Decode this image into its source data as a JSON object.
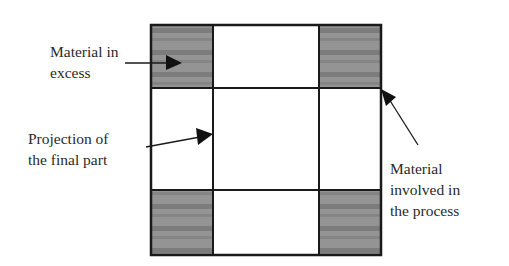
{
  "diagram": {
    "labels": {
      "material_in_excess": [
        "Material in",
        "excess"
      ],
      "projection_final_part": [
        "Projection of",
        "the final part"
      ],
      "material_involved": [
        "Material",
        "involved in",
        "the process"
      ]
    },
    "grid": {
      "rows": 3,
      "cols": 3,
      "shaded_cells": [
        "top-left",
        "top-right",
        "bottom-left",
        "bottom-right"
      ],
      "center_cell": "final part projection"
    },
    "colors": {
      "shade": "#8e8e8e",
      "stripe": "#777777",
      "line": "#1a1a1a"
    }
  }
}
